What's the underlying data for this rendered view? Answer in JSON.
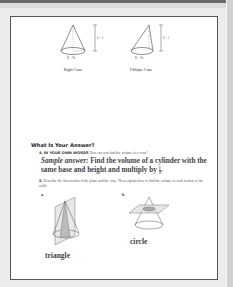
{
  "figures": {
    "right_cone": {
      "caption": "Right Cone",
      "height_label": "h = 5",
      "base_label": "B = 9π"
    },
    "oblique_cone": {
      "caption": "Oblique Cone",
      "height_label": "h = 5",
      "base_label": "B = 9π"
    }
  },
  "section": {
    "title": "What Is Your Answer?"
  },
  "question4": {
    "number": "4.",
    "lead": "IN YOUR OWN WORDS",
    "prompt": "How can you find the volume of a cone?",
    "answer_prefix": "Sample answer:",
    "answer_text": "Find the volume of a cylinder with the same base and height and multiply by",
    "fraction": {
      "numerator": "1",
      "denominator": "3"
    },
    "answer_end": "."
  },
  "question5": {
    "number": "5.",
    "prompt": "Describe the intersection of the plane and the cone. Then explain how to find the volume of each section of the solid.",
    "parts": [
      {
        "label": "a.",
        "answer": "triangle"
      },
      {
        "label": "b.",
        "answer": "circle"
      }
    ]
  }
}
